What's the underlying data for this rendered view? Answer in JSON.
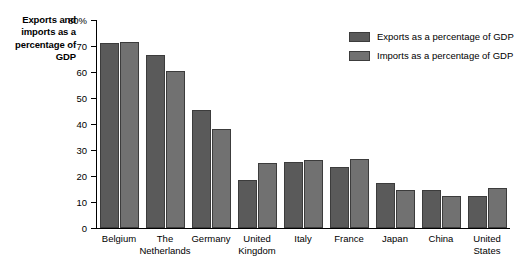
{
  "chart_data": {
    "type": "bar",
    "title": "",
    "xlabel": "",
    "ylabel": "Exports and imports as a percentage of GDP",
    "ylim": [
      0,
      80
    ],
    "ytick_labels": [
      "80%",
      "70",
      "60",
      "50",
      "40",
      "30",
      "20",
      "10",
      "0"
    ],
    "ytick_values": [
      80,
      70,
      60,
      50,
      40,
      30,
      20,
      10,
      0
    ],
    "grid": false,
    "legend_position": "top-right",
    "categories": [
      "Belgium",
      "The\nNetherlands",
      "Germany",
      "United\nKingdom",
      "Italy",
      "France",
      "Japan",
      "China",
      "United\nStates"
    ],
    "series": [
      {
        "name": "Exports as a percentage of GDP",
        "color": "#5a5a5a",
        "values": [
          71,
          66.5,
          45.5,
          18.5,
          25.5,
          23.5,
          17.5,
          14.5,
          12.5
        ]
      },
      {
        "name": "Imports as a percentage of GDP",
        "color": "#717171",
        "values": [
          71.5,
          60.5,
          38,
          25,
          26,
          26.5,
          14.5,
          12.5,
          15.5
        ]
      }
    ]
  },
  "colors": {
    "exports": "#5a5a5a",
    "imports": "#717171",
    "bar_outline": "#3c3c3c",
    "axis": "#000000",
    "background": "#ffffff"
  }
}
